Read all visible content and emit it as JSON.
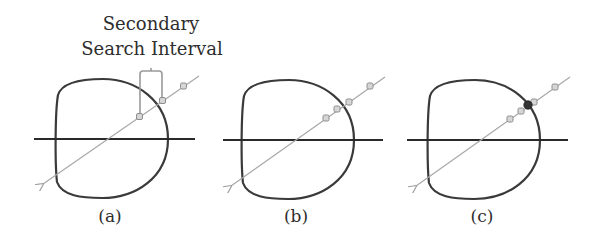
{
  "annotation": {
    "line1": "Secondary",
    "line2": "Search Interval"
  },
  "panels": [
    {
      "id": "a",
      "label": "(a)",
      "sample_points": 3,
      "highlighted_point": false,
      "has_bracket": true
    },
    {
      "id": "b",
      "label": "(b)",
      "sample_points": 4,
      "highlighted_point": false,
      "has_bracket": false
    },
    {
      "id": "c",
      "label": "(c)",
      "sample_points": 5,
      "highlighted_point": true,
      "has_bracket": false
    }
  ],
  "colors": {
    "outline": "#3a3a3a",
    "axis": "#2a2a2a",
    "ray": "#a8a8a8",
    "marker_stroke": "#8c8c8c",
    "marker_fill": "#d6d6d6",
    "highlight": "#333333",
    "text": "#2e2e2e"
  }
}
